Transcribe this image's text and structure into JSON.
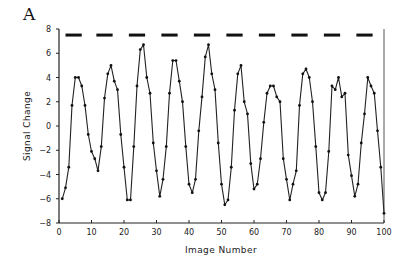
{
  "panel_label": "A",
  "chart_data": {
    "type": "line",
    "title": "",
    "xlabel": "Image Number",
    "ylabel": "Signal Change",
    "xlim": [
      0,
      100
    ],
    "ylim": [
      -8,
      8
    ],
    "x_ticks": [
      0,
      10,
      20,
      30,
      40,
      50,
      60,
      70,
      80,
      90,
      100
    ],
    "y_ticks": [
      -8,
      -6,
      -4,
      -2,
      0,
      2,
      4,
      6,
      8
    ],
    "grid": false,
    "legend": null,
    "markers": "small filled dots",
    "series": [
      {
        "name": "Signal Change",
        "x": [
          1,
          2,
          3,
          4,
          5,
          6,
          7,
          8,
          9,
          10,
          11,
          12,
          13,
          14,
          15,
          16,
          17,
          18,
          19,
          20,
          21,
          22,
          23,
          24,
          25,
          26,
          27,
          28,
          29,
          30,
          31,
          32,
          33,
          34,
          35,
          36,
          37,
          38,
          39,
          40,
          41,
          42,
          43,
          44,
          45,
          46,
          47,
          48,
          49,
          50,
          51,
          52,
          53,
          54,
          55,
          56,
          57,
          58,
          59,
          60,
          61,
          62,
          63,
          64,
          65,
          66,
          67,
          68,
          69,
          70,
          71,
          72,
          73,
          74,
          75,
          76,
          77,
          78,
          79,
          80,
          81,
          82,
          83,
          84,
          85,
          86,
          87,
          88,
          89,
          90,
          91,
          92,
          93,
          94,
          95,
          96,
          97,
          98,
          99,
          100
        ],
        "values": [
          -6.0,
          -5.1,
          -3.4,
          1.7,
          4.0,
          4.0,
          3.3,
          1.7,
          -0.7,
          -2.1,
          -2.7,
          -3.7,
          -1.7,
          2.3,
          4.3,
          5.0,
          3.7,
          3.0,
          -0.7,
          -3.4,
          -6.1,
          -6.1,
          -1.7,
          3.3,
          6.3,
          6.7,
          4.0,
          2.7,
          -1.4,
          -3.7,
          -5.8,
          -4.4,
          -1.7,
          2.7,
          5.4,
          5.4,
          3.7,
          2.0,
          -1.7,
          -4.8,
          -5.5,
          -4.4,
          -0.4,
          2.4,
          5.7,
          6.7,
          4.3,
          3.0,
          -1.4,
          -4.8,
          -6.5,
          -6.1,
          -3.4,
          1.3,
          4.3,
          5.0,
          2.0,
          1.0,
          -3.1,
          -5.2,
          -4.8,
          -2.7,
          0.3,
          2.7,
          3.3,
          3.3,
          2.4,
          2.0,
          -2.7,
          -4.4,
          -6.1,
          -4.8,
          -3.7,
          1.7,
          4.3,
          4.7,
          4.0,
          2.0,
          -1.7,
          -5.5,
          -6.1,
          -5.5,
          -2.1,
          3.3,
          3.0,
          4.0,
          2.4,
          2.7,
          -2.4,
          -4.1,
          -5.8,
          -4.8,
          -1.4,
          1.0,
          4.0,
          3.3,
          2.7,
          -0.4,
          -3.4,
          -7.2
        ]
      }
    ],
    "annotations": [
      {
        "type": "dashed-line",
        "description": "stimulus blocks (task periods)",
        "y": 7.5,
        "segments": [
          [
            2,
            7
          ],
          [
            11.5,
            16.5
          ],
          [
            21.5,
            26.5
          ],
          [
            31.5,
            36.5
          ],
          [
            41.5,
            46.5
          ],
          [
            51.5,
            56.5
          ],
          [
            61.5,
            66.5
          ],
          [
            71.5,
            76.5
          ],
          [
            81.5,
            86.5
          ],
          [
            91.5,
            96.5
          ]
        ]
      }
    ]
  }
}
